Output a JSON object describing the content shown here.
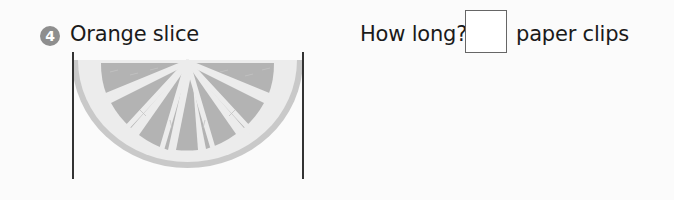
{
  "problem": {
    "number": "4",
    "title": "Orange slice",
    "question": "How long?",
    "answer_value": "",
    "unit_label": "paper clips"
  },
  "image": {
    "subject": "orange-slice",
    "segments": 8
  },
  "colors": {
    "badge": "#8e8e8e",
    "rind": "#c9c9c9",
    "pith": "#ececec",
    "pulp": "#b3b3b3",
    "line": "#333333"
  }
}
